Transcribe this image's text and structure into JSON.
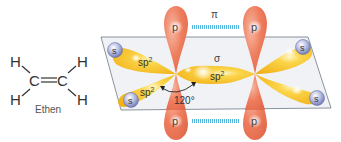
{
  "structural_formula": {
    "atoms": {
      "h_top_left": "H",
      "h_bottom_left": "H",
      "h_top_right": "H",
      "h_bottom_right": "H",
      "c_left": "C",
      "c_right": "C"
    },
    "bond": "=",
    "name": "Ethen"
  },
  "orbital_diagram": {
    "pi_label": "π",
    "sigma_label": "σ",
    "angle_label": "120°",
    "p_label": "p",
    "s_label": "s",
    "sp2_base": "sp",
    "sp2_sup": "2",
    "colors": {
      "p_orbital": "#ee7e5e",
      "sp2_orbital": "#f6bc1e",
      "s_orbital": "#8a92c8",
      "plane_fill": "#eef0f3",
      "plane_stroke": "#6d7a86",
      "pi_bond": "#59b4dc"
    }
  }
}
